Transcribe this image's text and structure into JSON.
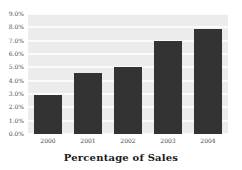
{
  "chart_data": {
    "type": "bar",
    "title": "Percentage of Sales",
    "xlabel": "",
    "ylabel": "",
    "categories": [
      "2000",
      "2001",
      "2002",
      "2003",
      "2004"
    ],
    "values": [
      2.9,
      4.6,
      5.0,
      7.0,
      7.9
    ],
    "value_suffix": "%",
    "ylim": [
      0.0,
      9.0
    ],
    "ytick_step": 1.0,
    "ytick_labels": [
      "9.0%",
      "8.0%",
      "7.0%",
      "6.0%",
      "5.0%",
      "4.0%",
      "3.0%",
      "2.0%",
      "1.0%",
      "0.0%"
    ],
    "ytick_values": [
      9.0,
      8.0,
      7.0,
      6.0,
      5.0,
      4.0,
      3.0,
      2.0,
      1.0,
      0.0
    ],
    "grid": true,
    "grid_orientation": "horizontal",
    "legend": false,
    "legend_position": "none",
    "series": [
      {
        "name": "Percentage of Sales",
        "values": [
          2.9,
          4.6,
          5.0,
          7.0,
          7.9
        ]
      }
    ]
  },
  "style": {
    "bar_color": "#333333",
    "plot_background": "#ececec",
    "gridline_color": "#fbfbfb",
    "page_background": "#ffffff",
    "axis_text_color": "#4a4a4a",
    "title_color": "#1a1a1a"
  }
}
